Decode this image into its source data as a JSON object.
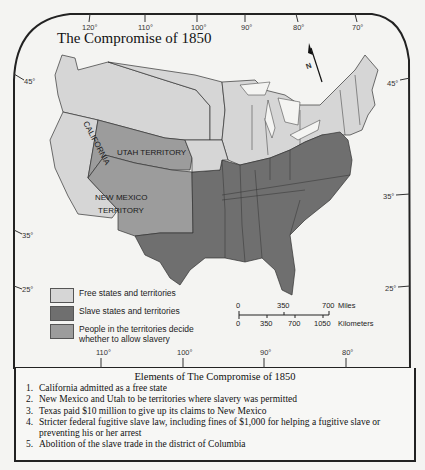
{
  "title": "The Compromise of 1850",
  "top_longitudes": [
    "120°",
    "110°",
    "100°",
    "90°",
    "80°",
    "70°"
  ],
  "bottom_longitudes": [
    "110°",
    "100°",
    "90°",
    "80°"
  ],
  "left_latitudes": [
    "45°",
    "35°",
    "25°"
  ],
  "right_latitudes": [
    "45°",
    "35°",
    "25°"
  ],
  "north_arrow_label": "N",
  "region_labels": {
    "california": "CALIFORNIA",
    "utah": "UTAH TERRITORY",
    "new_mexico_line1": "NEW MEXICO",
    "new_mexico_line2": "TERRITORY"
  },
  "colors": {
    "free": "#d6d6d6",
    "slave": "#6f6f6f",
    "popular_sovereignty": "#9c9c9c",
    "background": "#f4f4f2",
    "border": "#222222"
  },
  "legend": [
    {
      "label": "Free states and territories",
      "category": "free"
    },
    {
      "label": "Slave states and territories",
      "category": "slave"
    },
    {
      "label": "People in the territories decide whether to allow slavery",
      "category": "popular_sovereignty"
    }
  ],
  "scale": {
    "miles_ticks": [
      "0",
      "350",
      "700"
    ],
    "miles_unit": "Miles",
    "km_ticks": [
      "0",
      "350",
      "700",
      "1050"
    ],
    "km_unit": "Kilometers"
  },
  "elements": {
    "title": "Elements of The Compromise of 1850",
    "items": [
      {
        "num": "1.",
        "text": "California admitted as a free state"
      },
      {
        "num": "2.",
        "text": "New Mexico and Utah to be territories where slavery was permitted"
      },
      {
        "num": "3.",
        "text": "Texas paid $10 million to give up its claims to New Mexico"
      },
      {
        "num": "4.",
        "text": "Stricter federal fugitive slave law, including fines of $1,000 for helping a fugitive slave or preventing his or her arrest"
      },
      {
        "num": "5.",
        "text": "Abolition of the slave trade in the district of Columbia"
      }
    ]
  }
}
